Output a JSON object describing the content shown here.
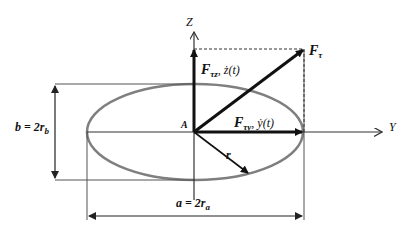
{
  "diagram": {
    "title": "",
    "axes": {
      "z_label": "Z",
      "y_label": "Y"
    },
    "origin_label": "A",
    "vectors": {
      "resultant": {
        "main": "F",
        "sub": "τ"
      },
      "z_component": {
        "main": "F",
        "sub": "τz",
        "rate": ", ż(t)"
      },
      "y_component": {
        "main": "F",
        "sub": "τy",
        "rate": ", ẏ(t)"
      },
      "radius": "r"
    },
    "dimensions": {
      "height": {
        "left": "b = 2r",
        "sub": "b"
      },
      "width": {
        "left": "a = 2r",
        "sub": "a"
      }
    },
    "colors": {
      "ellipse": "#7f7f7f",
      "lines": "#444444",
      "vectors": "#111111"
    }
  }
}
